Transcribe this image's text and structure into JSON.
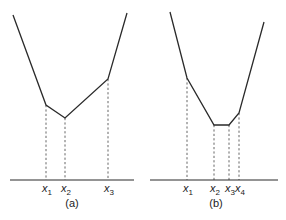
{
  "panels": [
    {
      "id": "a",
      "caption": "(a)",
      "axis": {
        "x1": 10,
        "x2": 134,
        "y": 180
      },
      "curve": [
        [
          13,
          15
        ],
        [
          46,
          105
        ],
        [
          65,
          118
        ],
        [
          108,
          79
        ],
        [
          127,
          13
        ]
      ],
      "breakpoints": [
        {
          "label": "x",
          "sub": "1",
          "x": 46,
          "y": 105
        },
        {
          "label": "x",
          "sub": "2",
          "x": 65,
          "y": 118
        },
        {
          "label": "x",
          "sub": "3",
          "x": 108,
          "y": 79
        }
      ],
      "caption_pos": {
        "x": 72,
        "y": 207
      }
    },
    {
      "id": "b",
      "caption": "(b)",
      "axis": {
        "x1": 150,
        "x2": 278,
        "y": 180
      },
      "curve": [
        [
          170,
          12
        ],
        [
          187,
          78
        ],
        [
          214,
          125
        ],
        [
          229,
          125
        ],
        [
          239,
          113
        ],
        [
          264,
          22
        ]
      ],
      "breakpoints": [
        {
          "label": "x",
          "sub": "1",
          "x": 187,
          "y": 78
        },
        {
          "label": "x",
          "sub": "2",
          "x": 214,
          "y": 125
        },
        {
          "label": "x",
          "sub": "3",
          "x": 229,
          "y": 125
        },
        {
          "label": "x",
          "sub": "4",
          "x": 239,
          "y": 113
        }
      ],
      "caption_pos": {
        "x": 216,
        "y": 207
      }
    }
  ],
  "colors": {
    "line": "#2a2a2a",
    "guide": "#555555",
    "text": "#222222"
  }
}
